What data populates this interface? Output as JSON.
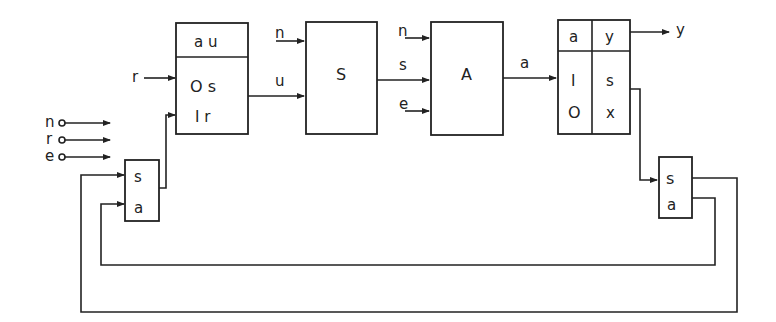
{
  "diagram": {
    "type": "block-diagram",
    "external_inputs": [
      {
        "label": "n"
      },
      {
        "label": "r"
      },
      {
        "label": "e"
      }
    ],
    "blocks": {
      "input_table": {
        "header": "a u",
        "rows": [
          "O s",
          "I r"
        ],
        "input_label": "r"
      },
      "s_block": {
        "label": "S",
        "inputs": [
          "n",
          "u"
        ]
      },
      "a_block": {
        "label": "A",
        "inputs": [
          "n",
          "s",
          "e"
        ],
        "output": "a"
      },
      "output_table": {
        "header_left": "a",
        "header_right": "y",
        "left_rows": [
          "I",
          "O"
        ],
        "right_rows": [
          "s",
          "x"
        ],
        "output_label": "y"
      },
      "left_selector": {
        "rows": [
          "s",
          "a"
        ]
      },
      "right_selector": {
        "rows": [
          "s",
          "a"
        ]
      }
    },
    "edges": [
      {
        "from": "r",
        "to": "input_table"
      },
      {
        "from": "left_selector",
        "to": "input_table.I r"
      },
      {
        "from": "input_table",
        "to": "s_block",
        "label": "u"
      },
      {
        "from": "n",
        "to": "s_block"
      },
      {
        "from": "s_block",
        "to": "a_block",
        "label": "s"
      },
      {
        "from": "n",
        "to": "a_block"
      },
      {
        "from": "e",
        "to": "a_block"
      },
      {
        "from": "a_block",
        "to": "output_table",
        "label": "a"
      },
      {
        "from": "output_table",
        "to": "y",
        "label": "y"
      },
      {
        "from": "output_table.s",
        "to": "right_selector.s"
      },
      {
        "from": "right_selector.a",
        "to": "left_selector.a",
        "kind": "feedback"
      },
      {
        "from": "right_selector.s",
        "to": "left_selector.s",
        "kind": "feedback"
      }
    ]
  }
}
